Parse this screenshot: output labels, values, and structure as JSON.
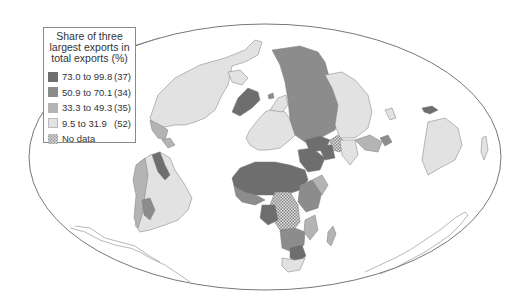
{
  "legend": {
    "title_lines": [
      "Share of three",
      "largest exports in",
      "total exports (%)"
    ],
    "items": [
      {
        "range": "73.0 to 99.8",
        "count": "(37)",
        "color": "#6e6e6e"
      },
      {
        "range": "50.9 to 70.1",
        "count": "(34)",
        "color": "#8c8c8c"
      },
      {
        "range": "33.3 to 49.3",
        "count": "(35)",
        "color": "#b4b4b4"
      },
      {
        "range": "9.5 to 31.9",
        "count": "(52)",
        "color": "#e2e2e2"
      },
      {
        "range": "No data",
        "count": "",
        "color": "hatch"
      }
    ]
  },
  "colors": {
    "c1": "#6e6e6e",
    "c2": "#8c8c8c",
    "c3": "#b4b4b4",
    "c4": "#e2e2e2",
    "border": "#7a7a7a",
    "ocean": "#ffffff"
  }
}
